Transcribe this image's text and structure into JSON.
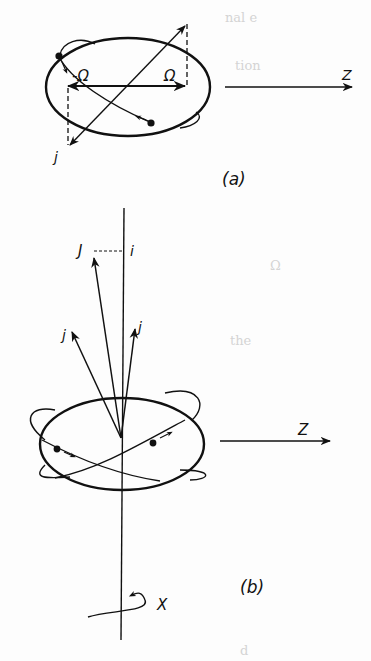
{
  "figure": {
    "panel_a": {
      "caption": "(a)",
      "labels": {
        "neg_omega": "-Ω",
        "omega": "Ω",
        "z_axis": "Z",
        "j": "j"
      }
    },
    "panel_b": {
      "caption": "(b)",
      "labels": {
        "J": "J",
        "i": "i",
        "j_left": "j",
        "j_right": "j",
        "z_axis": "Z",
        "x_axis": "X"
      }
    }
  },
  "colors": {
    "ink": "#111111",
    "paper": "#fdfdfd",
    "bleed": "#d4d4d4"
  }
}
